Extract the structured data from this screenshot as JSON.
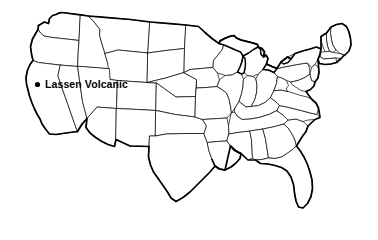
{
  "figure": {
    "type": "outline-map",
    "region": "Contiguous United States",
    "background_color": "#ffffff",
    "line_color": "#000000",
    "fill_color": "#ffffff",
    "state_boundaries_visible": true,
    "national_outline_visible": true,
    "great_lakes_visible": true
  },
  "markers": [
    {
      "label": "Lassen Volcanic",
      "marker_shape": "filled-circle",
      "marker_color": "#000000",
      "marker_x": 37.5,
      "marker_y": 84.5,
      "marker_radius": 2.6,
      "label_x": 45,
      "label_y": 79,
      "label_color": "#000000",
      "label_weight": "bold",
      "located_in": "northern California"
    }
  ],
  "legend": {
    "present": false
  },
  "title": {
    "present": false,
    "text": ""
  }
}
